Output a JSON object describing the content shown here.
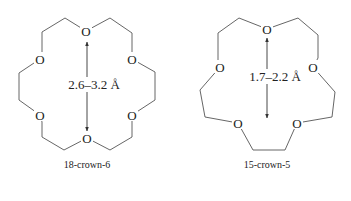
{
  "figure": {
    "molecules": [
      {
        "name": "18-crown-6",
        "caption": "18-crown-6",
        "ring_size": 18,
        "oxygen_count": 6,
        "atom_label": "O",
        "cavity_diameter_label": "2.6–3.2 Å"
      },
      {
        "name": "15-crown-5",
        "caption": "15-crown-5",
        "ring_size": 15,
        "oxygen_count": 5,
        "atom_label": "O",
        "cavity_diameter_label": "1.7–2.2 Å"
      }
    ],
    "colors": {
      "background": "#ffffff",
      "bond": "#555555",
      "text": "#222222"
    }
  }
}
